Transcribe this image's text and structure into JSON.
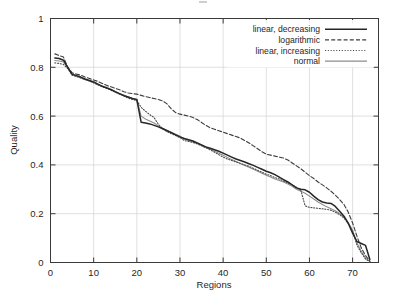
{
  "chart_data": {
    "type": "line",
    "title": "",
    "subtitle": "",
    "xlabel": "Regions",
    "ylabel": "Quality",
    "xlim": [
      0,
      76
    ],
    "ylim": [
      0,
      1
    ],
    "xticks": [
      0,
      10,
      20,
      30,
      40,
      50,
      60,
      70
    ],
    "yticks": [
      0,
      0.2,
      0.4,
      0.6,
      0.8,
      1
    ],
    "xticklabels": [
      "0",
      "10",
      "20",
      "30",
      "40",
      "50",
      "60",
      "70"
    ],
    "yticklabels": [
      "0",
      "0.2",
      "0.4",
      "0.6",
      "0.8",
      "1"
    ],
    "grid": true,
    "legend_position": "top-right",
    "annotations": [],
    "series": [
      {
        "name": "linear, decreasing",
        "style": "solid",
        "color": "#262626",
        "x": [
          1,
          2,
          3,
          4,
          5,
          6,
          7,
          8,
          9,
          10,
          11,
          12,
          13,
          14,
          15,
          16,
          17,
          18,
          19,
          20,
          21,
          22,
          23,
          24,
          25,
          26,
          27,
          28,
          29,
          30,
          31,
          32,
          33,
          34,
          35,
          36,
          37,
          38,
          39,
          40,
          41,
          42,
          43,
          44,
          45,
          46,
          47,
          48,
          49,
          50,
          51,
          52,
          53,
          54,
          55,
          56,
          57,
          58,
          59,
          60,
          61,
          62,
          63,
          64,
          65,
          66,
          67,
          68,
          69,
          70,
          71,
          72,
          73,
          74
        ],
        "y": [
          0.838,
          0.836,
          0.829,
          0.8,
          0.772,
          0.766,
          0.76,
          0.752,
          0.746,
          0.74,
          0.731,
          0.722,
          0.716,
          0.709,
          0.7,
          0.692,
          0.684,
          0.678,
          0.672,
          0.668,
          0.575,
          0.572,
          0.568,
          0.562,
          0.556,
          0.548,
          0.54,
          0.532,
          0.523,
          0.515,
          0.508,
          0.503,
          0.498,
          0.49,
          0.482,
          0.474,
          0.468,
          0.462,
          0.456,
          0.448,
          0.44,
          0.432,
          0.424,
          0.418,
          0.412,
          0.405,
          0.398,
          0.39,
          0.382,
          0.374,
          0.368,
          0.36,
          0.35,
          0.34,
          0.33,
          0.318,
          0.306,
          0.3,
          0.298,
          0.288,
          0.272,
          0.258,
          0.248,
          0.244,
          0.242,
          0.23,
          0.21,
          0.19,
          0.16,
          0.12,
          0.086,
          0.078,
          0.07,
          0.012
        ]
      },
      {
        "name": "logarithmic",
        "style": "dashed",
        "color": "#3d3d3d",
        "x": [
          1,
          2,
          3,
          4,
          5,
          6,
          7,
          8,
          9,
          10,
          11,
          12,
          13,
          14,
          15,
          16,
          17,
          18,
          19,
          20,
          21,
          22,
          23,
          24,
          25,
          26,
          27,
          28,
          29,
          30,
          31,
          32,
          33,
          34,
          35,
          36,
          37,
          38,
          39,
          40,
          41,
          42,
          43,
          44,
          45,
          46,
          47,
          48,
          49,
          50,
          51,
          52,
          53,
          54,
          55,
          56,
          57,
          58,
          59,
          60,
          61,
          62,
          63,
          64,
          65,
          66,
          67,
          68,
          69,
          70,
          71,
          72,
          73,
          74
        ],
        "y": [
          0.855,
          0.848,
          0.842,
          0.8,
          0.778,
          0.772,
          0.768,
          0.76,
          0.754,
          0.748,
          0.742,
          0.734,
          0.726,
          0.72,
          0.714,
          0.708,
          0.7,
          0.695,
          0.692,
          0.69,
          0.685,
          0.68,
          0.676,
          0.672,
          0.668,
          0.662,
          0.65,
          0.63,
          0.614,
          0.608,
          0.604,
          0.6,
          0.594,
          0.586,
          0.574,
          0.562,
          0.552,
          0.546,
          0.54,
          0.534,
          0.528,
          0.522,
          0.516,
          0.51,
          0.5,
          0.49,
          0.478,
          0.466,
          0.454,
          0.444,
          0.44,
          0.436,
          0.432,
          0.428,
          0.42,
          0.408,
          0.396,
          0.384,
          0.37,
          0.356,
          0.344,
          0.33,
          0.318,
          0.306,
          0.292,
          0.276,
          0.258,
          0.238,
          0.206,
          0.162,
          0.108,
          0.06,
          0.028,
          0.006
        ]
      },
      {
        "name": "linear, increasing",
        "style": "dotted",
        "color": "#4a4a4a",
        "x": [
          1,
          2,
          3,
          4,
          5,
          6,
          7,
          8,
          9,
          10,
          11,
          12,
          13,
          14,
          15,
          16,
          17,
          18,
          19,
          20,
          21,
          22,
          23,
          24,
          25,
          26,
          27,
          28,
          29,
          30,
          31,
          32,
          33,
          34,
          35,
          36,
          37,
          38,
          39,
          40,
          41,
          42,
          43,
          44,
          45,
          46,
          47,
          48,
          49,
          50,
          51,
          52,
          53,
          54,
          55,
          56,
          57,
          58,
          59,
          60,
          61,
          62,
          63,
          64,
          65,
          66,
          67,
          68,
          69,
          70,
          71,
          72,
          73,
          74
        ],
        "y": [
          0.818,
          0.816,
          0.812,
          0.795,
          0.768,
          0.762,
          0.756,
          0.75,
          0.744,
          0.736,
          0.728,
          0.72,
          0.714,
          0.706,
          0.698,
          0.69,
          0.682,
          0.674,
          0.668,
          0.664,
          0.636,
          0.62,
          0.606,
          0.594,
          0.566,
          0.548,
          0.536,
          0.528,
          0.52,
          0.512,
          0.5,
          0.496,
          0.492,
          0.486,
          0.478,
          0.47,
          0.462,
          0.452,
          0.442,
          0.432,
          0.424,
          0.418,
          0.412,
          0.406,
          0.4,
          0.394,
          0.386,
          0.378,
          0.37,
          0.362,
          0.356,
          0.348,
          0.342,
          0.334,
          0.326,
          0.318,
          0.308,
          0.296,
          0.232,
          0.226,
          0.224,
          0.222,
          0.22,
          0.218,
          0.214,
          0.206,
          0.196,
          0.182,
          0.16,
          0.128,
          0.072,
          0.04,
          0.014,
          0.004
        ]
      },
      {
        "name": "normal",
        "style": "solid-light",
        "color": "#8d8d8d",
        "x": [
          1,
          2,
          3,
          4,
          5,
          6,
          7,
          8,
          9,
          10,
          11,
          12,
          13,
          14,
          15,
          16,
          17,
          18,
          19,
          20,
          21,
          22,
          23,
          24,
          25,
          26,
          27,
          28,
          29,
          30,
          31,
          32,
          33,
          34,
          35,
          36,
          37,
          38,
          39,
          40,
          41,
          42,
          43,
          44,
          45,
          46,
          47,
          48,
          49,
          50,
          51,
          52,
          53,
          54,
          55,
          56,
          57,
          58,
          59,
          60,
          61,
          62,
          63,
          64,
          65,
          66,
          67,
          68,
          69,
          70,
          71,
          72,
          73,
          74
        ],
        "y": [
          0.828,
          0.826,
          0.822,
          0.798,
          0.77,
          0.764,
          0.758,
          0.75,
          0.744,
          0.738,
          0.73,
          0.722,
          0.714,
          0.708,
          0.7,
          0.692,
          0.686,
          0.678,
          0.672,
          0.666,
          0.6,
          0.588,
          0.58,
          0.572,
          0.56,
          0.55,
          0.542,
          0.534,
          0.526,
          0.518,
          0.506,
          0.5,
          0.494,
          0.488,
          0.48,
          0.472,
          0.464,
          0.456,
          0.448,
          0.44,
          0.43,
          0.422,
          0.414,
          0.406,
          0.398,
          0.39,
          0.382,
          0.374,
          0.366,
          0.358,
          0.35,
          0.342,
          0.336,
          0.33,
          0.322,
          0.312,
          0.3,
          0.292,
          0.284,
          0.272,
          0.26,
          0.248,
          0.238,
          0.228,
          0.22,
          0.212,
          0.2,
          0.186,
          0.164,
          0.132,
          0.08,
          0.046,
          0.018,
          0.004
        ]
      }
    ]
  },
  "caption": {
    "text": ""
  }
}
